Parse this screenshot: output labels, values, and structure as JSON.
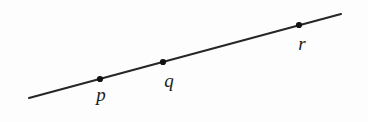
{
  "figure": {
    "background_color": "#fdfdfd",
    "line_color": "#262626",
    "point_color": "#111111",
    "label_color": "#1b1b1b",
    "line": {
      "x1": 29,
      "y1": 98,
      "x2": 341,
      "y2": 14,
      "stroke_width": 2.1
    },
    "points": [
      {
        "label": "p",
        "cx": 100,
        "cy": 79,
        "r": 3.1,
        "label_x": 101,
        "label_y": 94
      },
      {
        "label": "q",
        "cx": 163,
        "cy": 62,
        "r": 3.1,
        "label_x": 169,
        "label_y": 80
      },
      {
        "label": "r",
        "cx": 299,
        "cy": 25,
        "r": 3.1,
        "label_x": 302,
        "label_y": 43
      }
    ]
  }
}
